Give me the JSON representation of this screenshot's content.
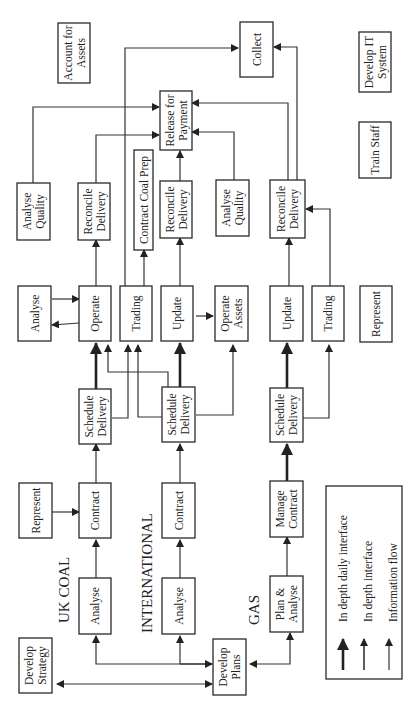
{
  "diagram": {
    "sections": {
      "uk_coal": "UK COAL",
      "international": "INTERNATIONAL",
      "gas": "GAS"
    },
    "boxes": {
      "account_for_assets": [
        "Account for",
        "Assets"
      ],
      "collect": [
        "Collect"
      ],
      "develop_it_system": [
        "Develop IT",
        "System"
      ],
      "release_for_payment": [
        "Release for",
        "Payment"
      ],
      "train_staff": [
        "Train Staff"
      ],
      "analyse_quality_1": [
        "Analyse",
        "Quality"
      ],
      "reconcile_delivery_1": [
        "Reconcile",
        "Delivery"
      ],
      "contract_coal_prep": [
        "Contract Coal Prep"
      ],
      "reconcile_delivery_2": [
        "Reconcile",
        "Delivery"
      ],
      "analyse_quality_2": [
        "Analyse",
        "Quality"
      ],
      "reconcile_delivery_3": [
        "Reconcile",
        "Delivery"
      ],
      "analyse_top": [
        "Analyse"
      ],
      "operate": [
        "Operate"
      ],
      "trading_1": [
        "Trading"
      ],
      "update_1": [
        "Update"
      ],
      "operate_assets": [
        "Operate",
        "Assets"
      ],
      "update_2": [
        "Update"
      ],
      "trading_2": [
        "Trading"
      ],
      "represent_right": [
        "Represent"
      ],
      "schedule_delivery_1": [
        "Schedule",
        "Delivery"
      ],
      "schedule_delivery_2": [
        "Schedule",
        "Delivery"
      ],
      "schedule_delivery_3": [
        "Schedule",
        "Delivery"
      ],
      "represent_left": [
        "Represent"
      ],
      "contract_1": [
        "Contract"
      ],
      "contract_2": [
        "Contract"
      ],
      "manage_contract": [
        "Manage",
        "Contract"
      ],
      "analyse_uk": [
        "Analyse"
      ],
      "analyse_intl": [
        "Analyse"
      ],
      "plan_analyse": [
        "Plan &",
        "Analyse"
      ],
      "develop_strategy": [
        "Develop",
        "Strategy"
      ],
      "develop_plans": [
        "Develop",
        "Plans"
      ]
    },
    "legend": {
      "items": [
        "In depth daily interface",
        "In depth interface",
        "Information flow"
      ]
    }
  }
}
